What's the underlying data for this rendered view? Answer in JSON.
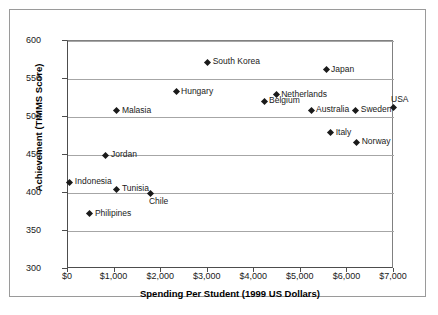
{
  "chart_data": {
    "type": "scatter",
    "title": "",
    "xlabel": "Spending Per Student (1999 US Dollars)",
    "ylabel": "Achievement (TIMMS Score)",
    "xlim": [
      0,
      7000
    ],
    "ylim": [
      300,
      600
    ],
    "xticks": [
      0,
      1000,
      2000,
      3000,
      4000,
      5000,
      6000,
      7000
    ],
    "xtick_labels": [
      "$0",
      "$1,000",
      "$2,000",
      "$3,000",
      "$4,000",
      "$5,000",
      "$6,000",
      "$7,000"
    ],
    "yticks": [
      300,
      350,
      400,
      450,
      500,
      550,
      600
    ],
    "ytick_labels": [
      "300",
      "350",
      "400",
      "450",
      "500",
      "550",
      "600"
    ],
    "grid": "horizontal",
    "legend": "none",
    "marker_color": "#1a1a1a",
    "marker_shape": "diamond",
    "points": [
      {
        "label": "Indonesia",
        "x": 40,
        "y": 414,
        "label_pos": "right"
      },
      {
        "label": "Philipines",
        "x": 470,
        "y": 373,
        "label_pos": "right"
      },
      {
        "label": "Jordan",
        "x": 815,
        "y": 450,
        "label_pos": "right"
      },
      {
        "label": "Tunisia",
        "x": 1050,
        "y": 405,
        "label_pos": "right"
      },
      {
        "label": "Malasia",
        "x": 1050,
        "y": 508,
        "label_pos": "right"
      },
      {
        "label": "Chile",
        "x": 1780,
        "y": 400,
        "label_pos": "below"
      },
      {
        "label": "Hungary",
        "x": 2320,
        "y": 533,
        "label_pos": "right"
      },
      {
        "label": "South Korea",
        "x": 3000,
        "y": 572,
        "label_pos": "right"
      },
      {
        "label": "Belgium",
        "x": 4210,
        "y": 521,
        "label_pos": "right"
      },
      {
        "label": "Netherlands",
        "x": 4470,
        "y": 529,
        "label_pos": "right"
      },
      {
        "label": "Australia",
        "x": 5220,
        "y": 509,
        "label_pos": "right"
      },
      {
        "label": "Japan",
        "x": 5540,
        "y": 562,
        "label_pos": "right"
      },
      {
        "label": "Italy",
        "x": 5640,
        "y": 479,
        "label_pos": "right"
      },
      {
        "label": "Sweden",
        "x": 6180,
        "y": 509,
        "label_pos": "right"
      },
      {
        "label": "Norway",
        "x": 6200,
        "y": 467,
        "label_pos": "right"
      },
      {
        "label": "USA",
        "x": 6980,
        "y": 512,
        "label_pos": "above"
      }
    ]
  }
}
